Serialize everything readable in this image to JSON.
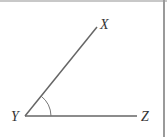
{
  "diagram": {
    "type": "angle",
    "vertex": {
      "label": "Y",
      "x": 25,
      "y": 116
    },
    "points": [
      {
        "label": "X",
        "x": 97,
        "y": 27
      },
      {
        "label": "Z",
        "x": 137,
        "y": 116
      }
    ],
    "angle_marked": "XYZ",
    "colors": {
      "line": "#666666",
      "border": "#9a9a9a"
    }
  }
}
